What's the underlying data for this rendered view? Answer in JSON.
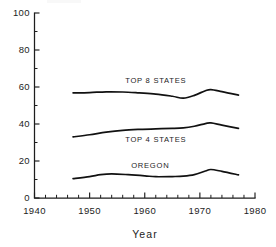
{
  "chart_data": {
    "type": "line",
    "title": "",
    "subtitle": "",
    "xlabel": "Year",
    "ylabel": "",
    "xlim": [
      1940,
      1980
    ],
    "ylim": [
      0,
      100
    ],
    "grid": false,
    "legend_position": "inline-labels",
    "x_major_ticks": [
      1940,
      1950,
      1960,
      1970,
      1980
    ],
    "x_major_tick_labels": [
      "1940",
      "1950",
      "1960",
      "1970",
      "1980"
    ],
    "x_minor_tick_step": 2,
    "y_major_ticks": [
      0,
      20,
      40,
      60,
      80,
      100
    ],
    "y_major_tick_labels": [
      "0",
      "20",
      "40",
      "60",
      "80",
      "100"
    ],
    "y_minor_tick_step": 10,
    "series": [
      {
        "name": "TOP 8 STATES",
        "label_x": 1962,
        "label_y": 64,
        "x": [
          1947,
          1950,
          1953,
          1956,
          1959,
          1962,
          1965,
          1967,
          1969,
          1971,
          1972,
          1974,
          1977
        ],
        "values": [
          56.8,
          57.0,
          57.4,
          57.3,
          56.8,
          56.2,
          55.0,
          54.0,
          55.5,
          58.0,
          58.6,
          57.5,
          55.6
        ]
      },
      {
        "name": "TOP 4 STATES",
        "label_x": 1962,
        "label_y": 32,
        "x": [
          1947,
          1950,
          1953,
          1956,
          1959,
          1962,
          1965,
          1967,
          1969,
          1971,
          1972,
          1974,
          1977
        ],
        "values": [
          33.0,
          34.2,
          35.6,
          36.6,
          37.1,
          37.4,
          37.6,
          37.9,
          38.8,
          40.2,
          40.6,
          39.4,
          37.6
        ]
      },
      {
        "name": "OREGON",
        "label_x": 1961,
        "label_y": 18,
        "x": [
          1947,
          1950,
          1952,
          1954,
          1957,
          1960,
          1962,
          1965,
          1967,
          1969,
          1971,
          1972,
          1974,
          1977
        ],
        "values": [
          10.5,
          11.6,
          12.6,
          13.0,
          12.6,
          12.0,
          11.5,
          11.6,
          11.8,
          12.6,
          14.6,
          15.4,
          14.4,
          12.5
        ]
      }
    ]
  },
  "figure": {
    "background_color": "#ffffff",
    "line_color": "#111111",
    "text_color": "#1d1d1d"
  }
}
